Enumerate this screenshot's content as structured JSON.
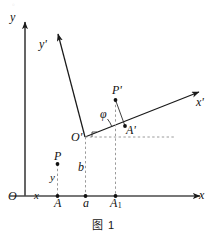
{
  "figure": {
    "caption": "图 1",
    "background_color": "#ffffff",
    "stroke_color": "#1a1a1a",
    "dashed_color": "#9a9a9a",
    "axes": {
      "primary": {
        "origin_label": "O",
        "x_axis_label": "x",
        "y_axis_label": "y"
      },
      "secondary": {
        "origin_label": "O'",
        "x_axis_label": "x'",
        "y_axis_label": "y'"
      }
    },
    "angle_label": "φ",
    "points": [
      {
        "name": "point-P",
        "label": "P"
      },
      {
        "name": "point-P-prime",
        "label": "P'"
      },
      {
        "name": "point-A",
        "label": "A"
      },
      {
        "name": "point-A-prime",
        "label": "A'"
      },
      {
        "name": "point-A-one",
        "label": "A",
        "subscript": "1"
      }
    ],
    "segment_labels": [
      {
        "name": "segment-x",
        "label": "x"
      },
      {
        "name": "segment-y",
        "label": "y"
      },
      {
        "name": "segment-a",
        "label": "a"
      },
      {
        "name": "segment-b",
        "label": "b"
      }
    ],
    "top_artifact": "。"
  }
}
